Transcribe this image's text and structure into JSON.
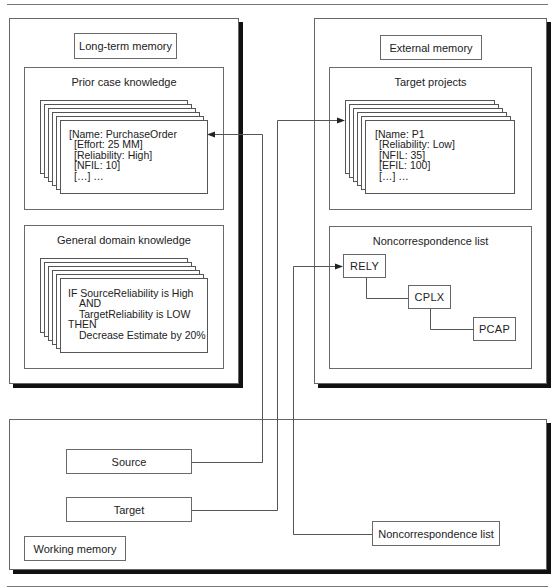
{
  "long_term_memory": {
    "label": "Long-term memory",
    "prior_case_knowledge": {
      "title": "Prior case knowledge",
      "card_lines": [
        "[Name: PurchaseOrder",
        "[Effort: 25 MM]",
        "[Reliability: High]",
        "[NFIL: 10]",
        "[…] …"
      ]
    },
    "general_domain_knowledge": {
      "title": "General domain knowledge",
      "card_lines": [
        "IF SourceReliability is High",
        "AND",
        "TargetReliability is LOW",
        "THEN",
        "Decrease Estimate by 20%"
      ]
    }
  },
  "external_memory": {
    "label": "External memory",
    "target_projects": {
      "title": "Target projects",
      "card_lines": [
        "[Name: P1",
        "[Reliability: Low]",
        "[NFIL: 35]",
        "[EFIL: 100]",
        "[…] …"
      ]
    },
    "noncorrespondence_list": {
      "title": "Noncorrespondence list",
      "items": [
        "RELY",
        "CPLX",
        "PCAP"
      ]
    }
  },
  "working_memory": {
    "label": "Working memory",
    "source": "Source",
    "target": "Target",
    "noncorrespondence_list": "Noncorrespondence list"
  }
}
